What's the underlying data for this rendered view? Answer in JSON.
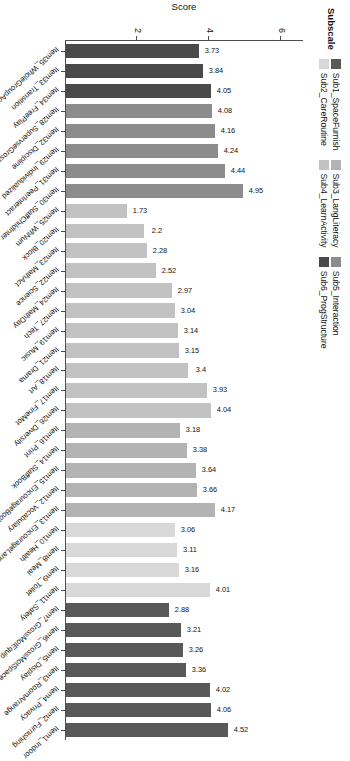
{
  "chart_data": {
    "type": "bar",
    "title": "",
    "xlabel": "Item",
    "ylabel": "Score",
    "ylim": [
      0,
      6.6
    ],
    "yticks": [
      2,
      4,
      6
    ],
    "grid": false,
    "orientation": "vertical-bars-rotated",
    "legend": {
      "title": "Subscale",
      "position": "top-left",
      "entries": [
        {
          "label": "Sub1_SpaceFurnish",
          "color": "#595959"
        },
        {
          "label": "Sub2_CareRoutine",
          "color": "#d9d9d9"
        },
        {
          "label": "Sub3_LangLiteracy",
          "color": "#b3b3b3"
        },
        {
          "label": "Sub4_LearnActivity",
          "color": "#c2c2c2"
        },
        {
          "label": "Sub5_Interaction",
          "color": "#8c8c8c"
        },
        {
          "label": "Sub6_ProgStructure",
          "color": "#4a4a4a"
        }
      ]
    },
    "categories": [
      "Item35_WholeGroupAct",
      "Item33_Transition",
      "Item34_FreePlay",
      "Item28_SupervseGrossMot",
      "Item32_Discipline",
      "Item29_Individualized",
      "Item31_PeerInteract",
      "Item30_StaffChildInter",
      "Item25_WhNum",
      "Item20_Block",
      "Item23_MathAct",
      "Item22_Science",
      "Item24_MathDay",
      "Item27_Tech",
      "Item19_Music",
      "Item21_Drama",
      "Item18_Art",
      "Item17_FineMot",
      "Item26_Diversity",
      "Item16_Print",
      "Item14_StaffBook",
      "Item15_EncourageBook",
      "Item12_Vocabulary",
      "Item13_EncourageLang",
      "Item10_Health",
      "Item8_Meal",
      "Item9_Toilet",
      "Item11_Safety",
      "Item7_GrossMotEquip",
      "Item6_GrossMotSpace",
      "Item5_Display",
      "Item3_RoomArrange",
      "Item4_Privacy",
      "Item2_Furnishing",
      "Item1_Indoor"
    ],
    "values": [
      3.73,
      3.84,
      4.05,
      4.08,
      4.16,
      4.24,
      4.44,
      4.95,
      1.73,
      2.2,
      2.28,
      2.52,
      2.97,
      3.04,
      3.14,
      3.15,
      3.4,
      3.93,
      4.04,
      3.18,
      3.38,
      3.64,
      3.66,
      4.17,
      3.06,
      3.11,
      3.16,
      4.01,
      2.88,
      3.21,
      3.26,
      3.36,
      4.02,
      4.06,
      4.52
    ],
    "value_labels": [
      "3.73",
      "3.84",
      "4.05",
      "4.08",
      "4.16",
      "4.24",
      "4.44",
      "4.95",
      "1.73",
      "2.2",
      "2.28",
      "2.52",
      "2.97",
      "3.04",
      "3.14",
      "3.15",
      "3.4",
      "3.93",
      "4.04",
      "3.18",
      "3.38",
      "3.64",
      "3.66",
      "4.17",
      "3.06",
      "3.11",
      "3.16",
      "4.01",
      "2.88",
      "3.21",
      "3.26",
      "3.36",
      "4.02",
      "4.06",
      "4.52"
    ],
    "series_of_bar": [
      "Sub6_ProgStructure",
      "Sub6_ProgStructure",
      "Sub6_ProgStructure",
      "Sub5_Interaction",
      "Sub5_Interaction",
      "Sub5_Interaction",
      "Sub5_Interaction",
      "Sub5_Interaction",
      "Sub4_LearnActivity",
      "Sub4_LearnActivity",
      "Sub4_LearnActivity",
      "Sub4_LearnActivity",
      "Sub4_LearnActivity",
      "Sub4_LearnActivity",
      "Sub4_LearnActivity",
      "Sub4_LearnActivity",
      "Sub4_LearnActivity",
      "Sub4_LearnActivity",
      "Sub4_LearnActivity",
      "Sub3_LangLiteracy",
      "Sub3_LangLiteracy",
      "Sub3_LangLiteracy",
      "Sub3_LangLiteracy",
      "Sub3_LangLiteracy",
      "Sub2_CareRoutine",
      "Sub2_CareRoutine",
      "Sub2_CareRoutine",
      "Sub2_CareRoutine",
      "Sub1_SpaceFurnish",
      "Sub1_SpaceFurnish",
      "Sub1_SpaceFurnish",
      "Sub1_SpaceFurnish",
      "Sub1_SpaceFurnish",
      "Sub1_SpaceFurnish",
      "Sub1_SpaceFurnish"
    ],
    "bar_colors": [
      "#4a4a4a",
      "#4a4a4a",
      "#4a4a4a",
      "#8c8c8c",
      "#8c8c8c",
      "#8c8c8c",
      "#8c8c8c",
      "#8c8c8c",
      "#c2c2c2",
      "#c2c2c2",
      "#c2c2c2",
      "#c2c2c2",
      "#c2c2c2",
      "#c2c2c2",
      "#c2c2c2",
      "#c2c2c2",
      "#c2c2c2",
      "#c2c2c2",
      "#c2c2c2",
      "#b3b3b3",
      "#b3b3b3",
      "#b3b3b3",
      "#b3b3b3",
      "#b3b3b3",
      "#d9d9d9",
      "#d9d9d9",
      "#d9d9d9",
      "#d9d9d9",
      "#595959",
      "#595959",
      "#595959",
      "#595959",
      "#595959",
      "#595959",
      "#595959"
    ]
  }
}
